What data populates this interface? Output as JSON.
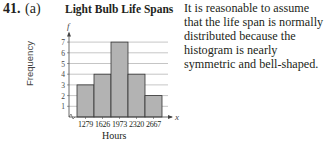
{
  "problem": {
    "number": "41.",
    "part": "(a)"
  },
  "explanation": "It is reasonable to assume that the life span is normally distributed because the histogram is nearly symmetric and bell-shaped.",
  "chart_data": {
    "type": "bar",
    "title": "Light Bulb Life Spans",
    "xlabel": "Hours",
    "ylabel": "Frequency",
    "y_axis_symbol": "f",
    "x_axis_symbol": "x",
    "categories": [
      "1279",
      "1626",
      "1973",
      "2320",
      "2667"
    ],
    "values": [
      3,
      4,
      7,
      4,
      2
    ],
    "yticks": [
      1,
      2,
      3,
      4,
      5,
      6,
      7
    ],
    "ylim": [
      0,
      8
    ],
    "grid": true,
    "bar_color": "#b3b3b3",
    "grid_color": "#9e9e9e"
  }
}
